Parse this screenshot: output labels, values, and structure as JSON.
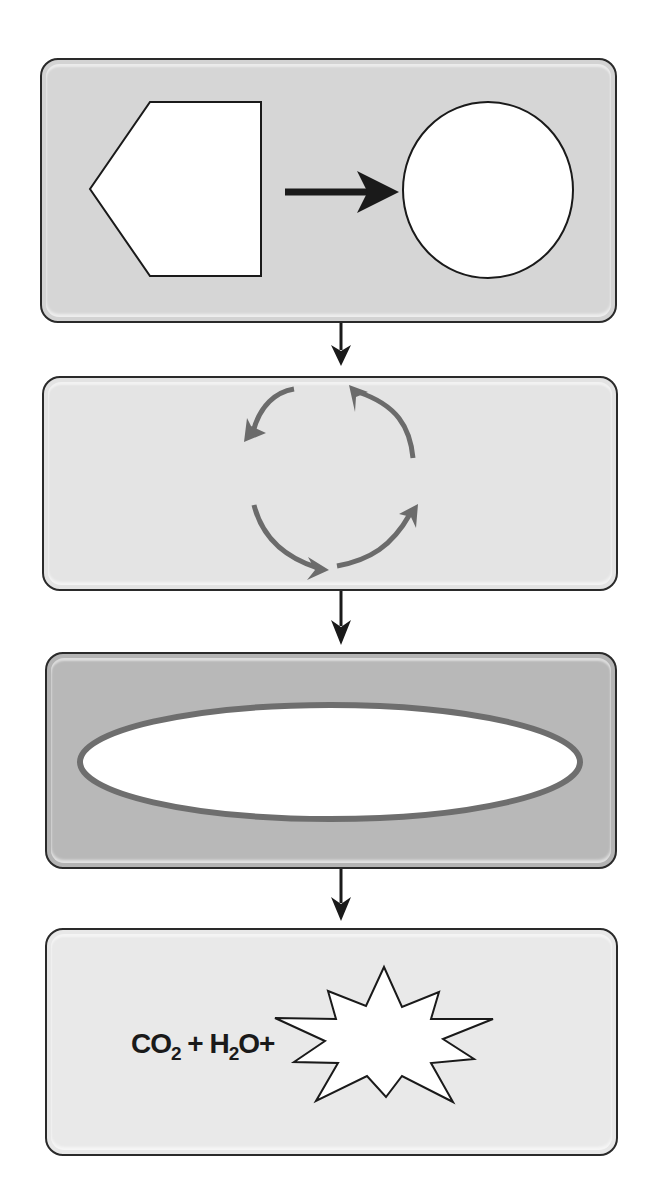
{
  "diagram": {
    "type": "vertical-flow",
    "colors": {
      "box1_fill": "#d3d3d3",
      "box2_fill": "#e3e3e3",
      "box3_fill": "#b4b4b4",
      "box4_fill": "#e8e8e8",
      "border": "#2a2a2a",
      "cycle_arrows": "#6b6b6b",
      "ellipse_stroke": "#6e6e6e",
      "connector": "#1a1a1a"
    },
    "boxes": [
      {
        "id": "step-1",
        "content": "pentagon shape arrow to circle"
      },
      {
        "id": "step-2",
        "content": "four gray circular arrows forming a cycle"
      },
      {
        "id": "step-3",
        "content": "white ellipse with thick gray outline"
      },
      {
        "id": "step-4",
        "content": "formula with starburst"
      }
    ],
    "formula": {
      "co": "CO",
      "sub1": "2",
      "plus1": " + H",
      "sub2": "2",
      "tail": "O+"
    }
  }
}
